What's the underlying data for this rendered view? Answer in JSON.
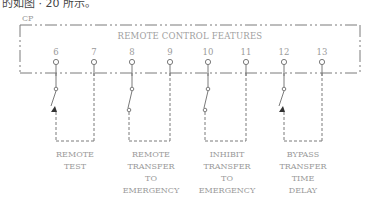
{
  "caption_fragment": "的如图 · 20 所示。",
  "diagram": {
    "panel_label": "CP",
    "title": "REMOTE CONTROL FEATURES",
    "colors": {
      "line": "#7a7a7a",
      "text": "#9a9a9a"
    },
    "pins": [
      "6",
      "7",
      "8",
      "9",
      "10",
      "11",
      "12",
      "13"
    ],
    "features": [
      {
        "id": "remote-test",
        "pins": [
          "6",
          "7"
        ],
        "switch": "normally-closed",
        "label": [
          "REMOTE",
          "TEST"
        ]
      },
      {
        "id": "remote-transfer-to-emergency",
        "pins": [
          "8",
          "9"
        ],
        "switch": "normally-open",
        "label": [
          "REMOTE",
          "TRANSFER",
          "TO",
          "EMERGENCY"
        ]
      },
      {
        "id": "inhibit-transfer-to-emergency",
        "pins": [
          "10",
          "11"
        ],
        "switch": "normally-open",
        "label": [
          "INHIBIT",
          "TRANSFER",
          "TO",
          "EMERGENCY"
        ]
      },
      {
        "id": "bypass-transfer-time-delay",
        "pins": [
          "12",
          "13"
        ],
        "switch": "normally-closed",
        "label": [
          "BYPASS",
          "TRANSFER",
          "TIME",
          "DELAY"
        ]
      }
    ]
  }
}
